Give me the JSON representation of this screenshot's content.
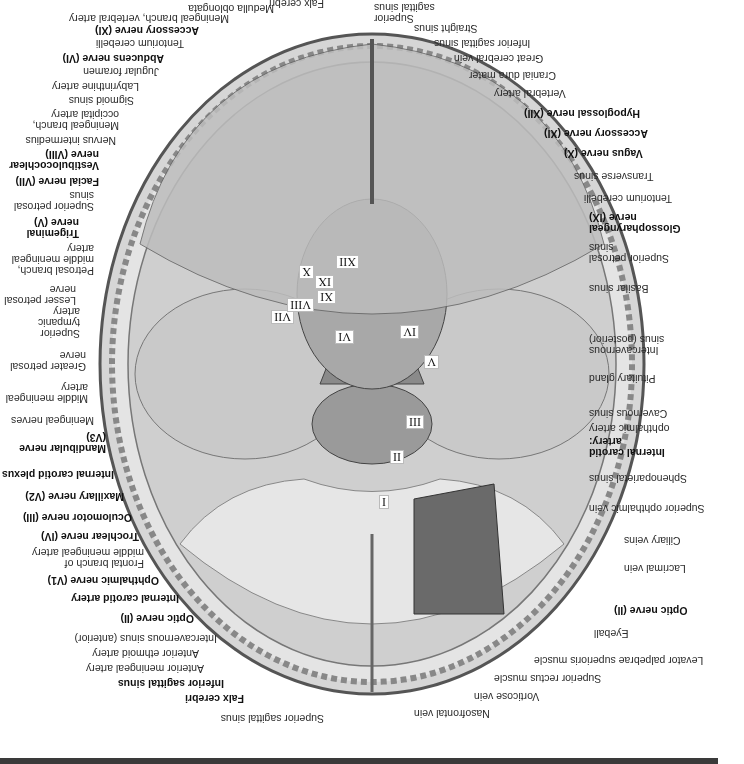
{
  "figure": {
    "orientation": "rotated 180 degrees",
    "left_labels": [
      {
        "text": "Superior sagittal sinus",
        "bold": false
      },
      {
        "text": "Falx cerebri",
        "bold": true
      },
      {
        "text": "Inferior sagittal sinus",
        "bold": true
      },
      {
        "text": "Anterior meningeal artery",
        "bold": false
      },
      {
        "text": "Anterior ethmoid artery",
        "bold": false
      },
      {
        "text": "Intercavernous sinus (anterior)",
        "bold": false
      },
      {
        "text": "Optic nerve (II)",
        "bold": true
      },
      {
        "text": "Internal carotid artery",
        "bold": true
      },
      {
        "text": "Ophthalmic nerve (V1)",
        "bold": true
      },
      {
        "text": "Frontal branch of\nmiddle meningeal artery",
        "bold": false
      },
      {
        "text": "Trochlear nerve (IV)",
        "bold": true
      },
      {
        "text": "Oculomotor nerve (III)",
        "bold": true
      },
      {
        "text": "Maxillary nerve (V2)",
        "bold": true
      },
      {
        "text": "Internal carotid plexus",
        "bold": true
      },
      {
        "text": "Mandibular nerve (V3)",
        "bold": true
      },
      {
        "text": "Meningeal nerves",
        "bold": false
      },
      {
        "text": "Middle meningeal\nartery",
        "bold": false
      },
      {
        "text": "Greater petrosal\nnerve",
        "bold": false
      },
      {
        "text": "Superior tympanic\nartery",
        "bold": false
      },
      {
        "text": "Lesser petrosal\nnerve",
        "bold": false
      },
      {
        "text": "Petrosal branch,\nmiddle meningeal\nartery",
        "bold": false
      },
      {
        "text": "Trigeminal\nnerve (V)",
        "bold": true
      },
      {
        "text": "Superior petrosal\nsinus",
        "bold": false
      },
      {
        "text": "Facial nerve (VII)",
        "bold": true
      },
      {
        "text": "Vestibulocochlear\nnerve (VIII)",
        "bold": true
      },
      {
        "text": "Nervus intermedius",
        "bold": false
      },
      {
        "text": "Meningeal branch,\noccipital artery",
        "bold": false
      },
      {
        "text": "Sigmoid sinus",
        "bold": false
      },
      {
        "text": "Labyrinthine artery",
        "bold": false
      },
      {
        "text": "Jugular foramen",
        "bold": false
      },
      {
        "text": "Abducens nerve (VI)",
        "bold": true
      },
      {
        "text": "Tentorium cerebelli",
        "bold": false
      },
      {
        "text": "Accessory nerve (XI)",
        "bold": true
      },
      {
        "text": "Meningeal branch, vertebral artery",
        "bold": false
      },
      {
        "text": "Medulla oblongata",
        "bold": false
      },
      {
        "text": "Falx cerebri",
        "bold": false
      }
    ],
    "right_labels": [
      {
        "text": "Nasofrontal vein",
        "bold": false
      },
      {
        "text": "Vorticose vein",
        "bold": false
      },
      {
        "text": "Superior rectus muscle",
        "bold": false
      },
      {
        "text": "Levator palpebrae superioris muscle",
        "bold": false
      },
      {
        "text": "Eyeball",
        "bold": false
      },
      {
        "text": "Optic nerve (II)",
        "bold": true
      },
      {
        "text": "Lacrimal vein",
        "bold": false
      },
      {
        "text": "Ciliary veins",
        "bold": false
      },
      {
        "text": "Superior ophthalmic vein",
        "bold": false
      },
      {
        "text": "Sphenoparietal sinus",
        "bold": false
      },
      {
        "text": "Internal carotid\nartery:",
        "bold": true
      },
      {
        "text": "ophthalmic artery",
        "bold": false
      },
      {
        "text": "Cavernous sinus",
        "bold": false
      },
      {
        "text": "Pituitary gland",
        "bold": false
      },
      {
        "text": "Intercavernous\nsinus (posterior)",
        "bold": false
      },
      {
        "text": "Basilar sinus",
        "bold": false
      },
      {
        "text": "Superior petrosal\nsinus",
        "bold": false
      },
      {
        "text": "Glossopharyngeal\nnerve (IX)",
        "bold": true
      },
      {
        "text": "Tentorium cerebelli",
        "bold": false
      },
      {
        "text": "Transverse sinus",
        "bold": false
      },
      {
        "text": "Vagus nerve (X)",
        "bold": true
      },
      {
        "text": "Accessory nerve (XI)",
        "bold": true
      },
      {
        "text": "Hypoglossal nerve (XII)",
        "bold": true
      },
      {
        "text": "Vertebral artery",
        "bold": false
      },
      {
        "text": "Cranial dura mater",
        "bold": false
      },
      {
        "text": "Great cerebral vein",
        "bold": false
      },
      {
        "text": "Inferior sagittal sinus",
        "bold": false
      },
      {
        "text": "Straight sinus",
        "bold": false
      },
      {
        "text": "Superior\nsagittal sinus",
        "bold": false
      }
    ],
    "roman_numerals": [
      "I",
      "II",
      "III",
      "IV",
      "V",
      "VI",
      "VII",
      "VIII",
      "IX",
      "X",
      "XI",
      "XII"
    ]
  }
}
